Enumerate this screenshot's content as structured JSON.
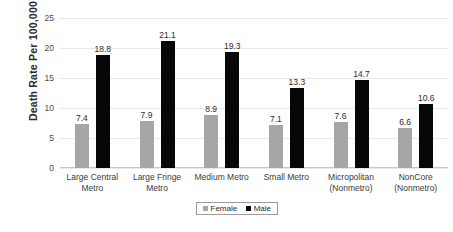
{
  "chart_data": {
    "type": "bar",
    "title": "",
    "xlabel": "",
    "ylabel": "Death Rate Per 100,000",
    "ylim": [
      0,
      25
    ],
    "yticks": [
      0,
      5,
      10,
      15,
      20,
      25
    ],
    "grid": true,
    "legend_position": "bottom",
    "categories": [
      "Large Central Metro",
      "Large Fringe Metro",
      "Medium Metro",
      "Small Metro",
      "Micropolitan (Nonmetro)",
      "NonCore (Nonmetro)"
    ],
    "category_lines": [
      [
        "Large Central",
        "Metro"
      ],
      [
        "Large Fringe",
        "Metro"
      ],
      [
        "Medium Metro",
        ""
      ],
      [
        "Small Metro",
        ""
      ],
      [
        "Micropolitan",
        "(Nonmetro)"
      ],
      [
        "NonCore",
        "(Nonmetro)"
      ]
    ],
    "series": [
      {
        "name": "Female",
        "color": "#A6A6A6",
        "values": [
          7.4,
          7.9,
          8.9,
          7.1,
          7.6,
          6.6
        ],
        "labels": [
          "7.4",
          "7.9",
          "8.9",
          "7.1",
          "7.6",
          "6.6"
        ]
      },
      {
        "name": "Male",
        "color": "#070707",
        "values": [
          18.8,
          21.1,
          19.3,
          13.3,
          14.7,
          10.6
        ],
        "labels": [
          "18.8",
          "21.1",
          "19.3",
          "13.3",
          "14.7",
          "10.6"
        ]
      }
    ]
  },
  "legend": {
    "items": [
      {
        "label": "Female",
        "swatch": "female"
      },
      {
        "label": "Male",
        "swatch": "male"
      }
    ]
  }
}
